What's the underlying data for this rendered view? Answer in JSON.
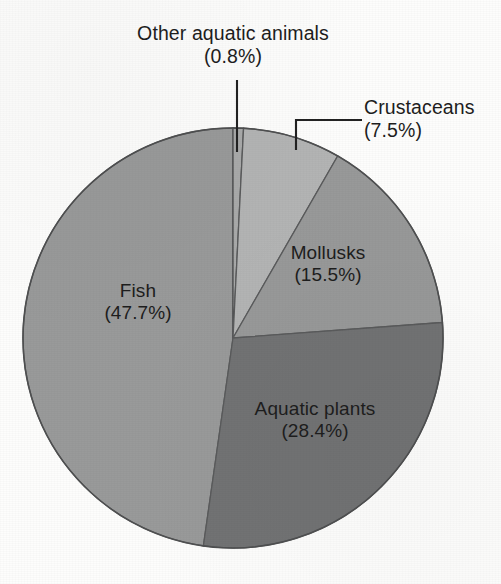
{
  "chart_data": {
    "type": "pie",
    "title": "",
    "subtitle": "",
    "xlabel": "",
    "ylabel": "",
    "legend_position": "none",
    "grid": false,
    "labels_include_percent": true,
    "total_percent": 99.9,
    "start_angle_deg": 0,
    "direction": "clockwise",
    "categories": [
      "Other aquatic animals",
      "Crustaceans",
      "Mollusks",
      "Aquatic plants",
      "Fish"
    ],
    "values": [
      0.8,
      7.5,
      15.5,
      28.4,
      47.7
    ],
    "slices": [
      {
        "name": "Other aquatic animals",
        "label": "Other aquatic animals",
        "percent": 0.8,
        "percent_text": "(0.8%)",
        "color": "#a9aaaa",
        "label_placement": "outside-leader",
        "leader": "vertical"
      },
      {
        "name": "Crustaceans",
        "label": "Crustaceans",
        "percent": 7.5,
        "percent_text": "(7.5%)",
        "color": "#b3b4b4",
        "label_placement": "outside-leader",
        "leader": "elbow"
      },
      {
        "name": "Mollusks",
        "label": "Mollusks",
        "percent": 15.5,
        "percent_text": "(15.5%)",
        "color": "#989999",
        "label_placement": "inside"
      },
      {
        "name": "Aquatic plants",
        "label": "Aquatic plants",
        "percent": 28.4,
        "percent_text": "(28.4%)",
        "color": "#727374",
        "label_placement": "inside"
      },
      {
        "name": "Fish",
        "label": "Fish",
        "percent": 47.7,
        "percent_text": "(47.7%)",
        "color": "#999a9a",
        "label_placement": "inside"
      }
    ],
    "geometry": {
      "center_x": 233,
      "center_y": 338,
      "radius": 210
    },
    "colors": {
      "crustaceans": "#b3b4b4",
      "mollusks": "#989999",
      "aquatic_plants": "#727374",
      "fish": "#999a9a",
      "other_aquatic_animals": "#a9aaaa",
      "outline": "#4f5051",
      "text": "#1d1d1d",
      "background": "#fdfdfc"
    }
  },
  "labels": {
    "other_aquatic_animals": {
      "name": "Other aquatic animals",
      "percent": "(0.8%)"
    },
    "crustaceans": {
      "name": "Crustaceans",
      "percent": "(7.5%)"
    },
    "mollusks": {
      "name": "Mollusks",
      "percent": "(15.5%)"
    },
    "fish": {
      "name": "Fish",
      "percent": "(47.7%)"
    },
    "aquatic_plants": {
      "name": "Aquatic plants",
      "percent": "(28.4%)"
    }
  }
}
